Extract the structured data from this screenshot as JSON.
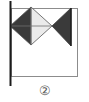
{
  "figure": {
    "caption": "②",
    "caption_number": "2",
    "background_color": "#ffffff",
    "canvas": {
      "width": 89,
      "height": 102
    },
    "colors": {
      "pole": "#1c1c1c",
      "frame_border": "#8c8c8c",
      "dark_fill": "#3a3a3a",
      "light_fill": "#ebebeb",
      "outline": "#555555",
      "caption_text": "#5a5a5a"
    },
    "elements": {
      "pole": {
        "label": "flag pole",
        "x": 10,
        "y_top": 1,
        "y_bottom": 86,
        "width": 2
      },
      "frame": {
        "label": "flag panel outline",
        "x": 11,
        "y": 8,
        "width": 67,
        "height": 69,
        "stroke_width": 1
      },
      "diamond": {
        "label": "bowtie diamond",
        "center_x": 31,
        "center_y": 26,
        "half_width": 21,
        "half_height": 19,
        "left_half_fill": "#3a3a3a",
        "right_half_fill": "#ebebeb",
        "has_horizontal_midline": true,
        "has_vertical_midline": true
      },
      "triangle": {
        "label": "left-pointing triangle",
        "apex_x": 52,
        "apex_y": 26,
        "base_x": 71,
        "base_y_top": 8,
        "base_y_bottom": 46,
        "fill": "#3a3a3a"
      }
    }
  }
}
